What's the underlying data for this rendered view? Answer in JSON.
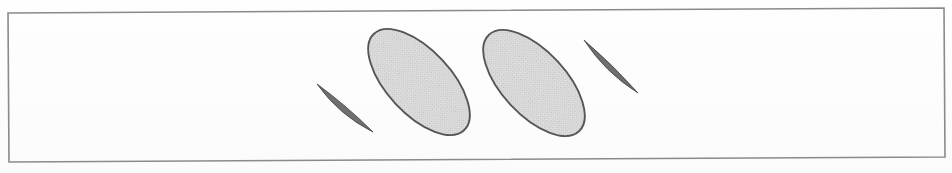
{
  "figure": {
    "title": "Scanned line figure: two shaded ellipses flanked by two thin lens slivers inside a rectangular frame",
    "canvas": {
      "width": 952,
      "height": 173
    },
    "background_color": "#fdfdfd",
    "frame": {
      "name": "outer-rectangle",
      "stroke_color": "#8a8a8a",
      "stroke_width": 1.6,
      "fill": "none",
      "corners": [
        {
          "x": 8,
          "y": 13
        },
        {
          "x": 944,
          "y": 8
        },
        {
          "x": 945,
          "y": 157
        },
        {
          "x": 9,
          "y": 162
        }
      ]
    },
    "shapes": [
      {
        "name": "sliver-left",
        "type": "lens",
        "role": "thin edge-on ellipse",
        "start": {
          "x": 317,
          "y": 84
        },
        "end": {
          "x": 373,
          "y": 132
        },
        "bulge": 4.6,
        "angle_deg": 40,
        "length": 74,
        "thickness": 6,
        "fill_color": "#6f6f6f",
        "stroke_color": "#3d3d3d",
        "stroke_width": 0.8
      },
      {
        "name": "ellipse-left",
        "type": "ellipse",
        "role": "shaded inclined disc",
        "center": {
          "x": 419,
          "y": 82
        },
        "rx": 66,
        "ry": 32,
        "angle_deg": 47,
        "fill_color": "#d2d2d2",
        "stroke_color": "#555555",
        "stroke_width": 1.9,
        "pattern": "halftone-dither"
      },
      {
        "name": "ellipse-right",
        "type": "ellipse",
        "role": "shaded inclined disc",
        "center": {
          "x": 534,
          "y": 83
        },
        "rx": 66,
        "ry": 32,
        "angle_deg": 47,
        "fill_color": "#d2d2d2",
        "stroke_color": "#555555",
        "stroke_width": 1.9,
        "pattern": "halftone-dither"
      },
      {
        "name": "sliver-right",
        "type": "lens",
        "role": "thin edge-on ellipse",
        "start": {
          "x": 584,
          "y": 40
        },
        "end": {
          "x": 638,
          "y": 93
        },
        "bulge": 4.2,
        "angle_deg": 44,
        "length": 76,
        "thickness": 6,
        "fill_color": "#6f6f6f",
        "stroke_color": "#3d3d3d",
        "stroke_width": 0.8
      }
    ],
    "colors": {
      "paper": "#fdfdfd",
      "frame_line": "#8a8a8a",
      "ellipse_fill": "#d2d2d2",
      "ellipse_outline": "#555555",
      "sliver_fill": "#6f6f6f"
    },
    "labels": []
  }
}
